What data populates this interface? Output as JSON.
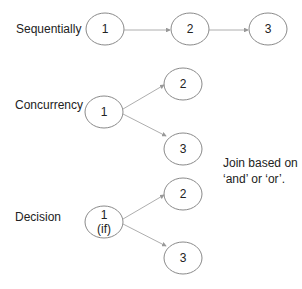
{
  "diagram": {
    "sections": [
      {
        "label": "Sequentially",
        "nodes": [
          "1",
          "2",
          "3"
        ]
      },
      {
        "label": "Concurrency",
        "nodes": [
          "1",
          "2",
          "3"
        ]
      },
      {
        "label": "Decision",
        "nodes": [
          "1",
          "2",
          "3"
        ],
        "node1_sub": "(if)"
      }
    ],
    "note": {
      "line1": "Join based on",
      "line2": "‘and’ or ‘or’."
    },
    "colors": {
      "stroke": "#8a8a8a",
      "arrow": "#999999",
      "text": "#222222"
    }
  }
}
